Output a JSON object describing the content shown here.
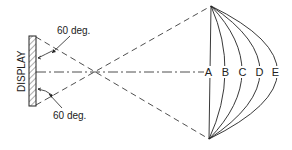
{
  "diagram": {
    "display_label": "DISPLAY",
    "angle_top_label": "60 deg.",
    "angle_bottom_label": "60 deg.",
    "curve_labels": [
      "A",
      "B",
      "C",
      "D",
      "E"
    ],
    "colors": {
      "line": "#222222",
      "background": "#ffffff"
    }
  }
}
